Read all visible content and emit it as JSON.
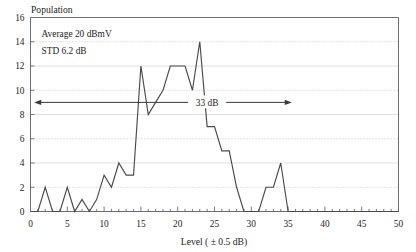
{
  "chart_data": {
    "type": "line",
    "title": "",
    "ylabel": "Population",
    "xlabel": "Level ( ± 0.5 dB)",
    "xlim": [
      0,
      50
    ],
    "ylim": [
      0,
      16
    ],
    "grid": true,
    "legend": "none",
    "x": [
      0,
      1,
      2,
      3,
      4,
      5,
      6,
      7,
      8,
      9,
      10,
      11,
      12,
      13,
      14,
      15,
      16,
      17,
      18,
      19,
      20,
      21,
      22,
      23,
      24,
      25,
      26,
      27,
      28,
      29,
      30,
      31,
      32,
      33,
      34,
      35,
      36,
      37,
      38,
      39,
      40,
      41,
      42,
      43,
      44,
      45,
      46,
      47,
      48,
      49,
      50
    ],
    "values": [
      0,
      0,
      2,
      0,
      0,
      2,
      0,
      1,
      0,
      1,
      3,
      2,
      4,
      3,
      3,
      12,
      8,
      9,
      10,
      12,
      12,
      12,
      10,
      14,
      7,
      7,
      5,
      5,
      2,
      0,
      0,
      0,
      2,
      2,
      4,
      0,
      0,
      0,
      0,
      0,
      0,
      0,
      0,
      0,
      0,
      0,
      0,
      0,
      0,
      0,
      0
    ],
    "series": [
      {
        "name": "Population",
        "values": [
          0,
          0,
          2,
          0,
          0,
          2,
          0,
          1,
          0,
          1,
          3,
          2,
          4,
          3,
          3,
          12,
          8,
          9,
          10,
          12,
          12,
          12,
          10,
          14,
          7,
          7,
          5,
          5,
          2,
          0,
          0,
          0,
          2,
          2,
          4,
          0,
          0,
          0,
          0,
          0,
          0,
          0,
          0,
          0,
          0,
          0,
          0,
          0,
          0,
          0,
          0
        ]
      }
    ],
    "xticks": [
      0,
      5,
      10,
      15,
      20,
      25,
      30,
      35,
      40,
      45,
      50
    ],
    "xtick_labels": [
      "0",
      "5",
      "10",
      "15",
      "20",
      "25",
      "30",
      "35",
      "40",
      "45",
      "50"
    ],
    "yticks": [
      0,
      2,
      4,
      6,
      8,
      10,
      12,
      14,
      16
    ],
    "ytick_labels": [
      "0",
      "2",
      "4",
      "6",
      "8",
      "10",
      "12",
      "14",
      "16"
    ],
    "minor_xtick_step": 1,
    "annotations": [
      {
        "name": "average-note",
        "text": "Average 20 dBmV",
        "x": 1.5,
        "y": 14.4
      },
      {
        "name": "std-note",
        "text": "STD 6.2 dB",
        "x": 1.5,
        "y": 13.0
      },
      {
        "name": "span-label",
        "text": "33 dB",
        "x": 24.0,
        "y": 9.0
      }
    ],
    "span_arrow": {
      "name": "range-arrow",
      "label": "33 dB",
      "y": 9.0,
      "x_start": 0.5,
      "x_end": 35.5,
      "double_headed": true
    }
  },
  "axis": {
    "y_title": "Population",
    "x_title": "Level ( ± 0.5 dB)"
  },
  "notes": {
    "average": "Average 20 dBmV",
    "std": "STD 6.2 dB",
    "span": "33 dB"
  },
  "colors": {
    "series": "#4a4a4a",
    "axis": "#6e6e6e",
    "grid_dotted": "#b9b9b9",
    "grid_solid": "#dcdcdc",
    "text": "#1c1c1c",
    "background": "#ffffff"
  }
}
